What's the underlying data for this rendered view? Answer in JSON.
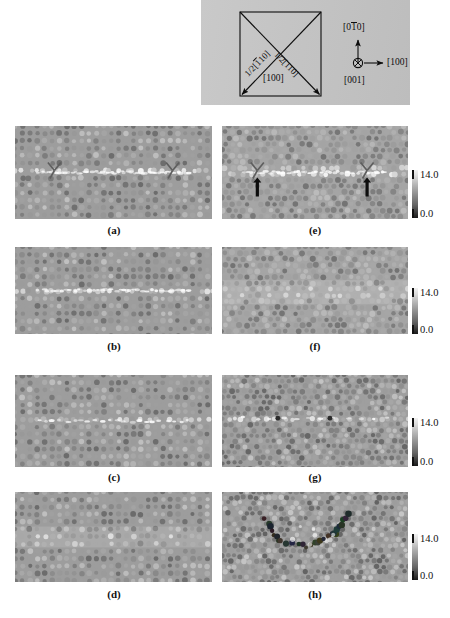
{
  "figure": {
    "type": "multi-panel-micrograph-figure",
    "panel_count": 8
  },
  "schematic": {
    "name": "crystal-orientation-schematic",
    "square_edge_label": "[100]",
    "diagonal_left_label": "1/2[110]",
    "diagonal_left_overbar_index": 1,
    "diagonal_right_label": "1/2[110]",
    "axes": {
      "up_label": "[010]",
      "up_overbar_index": 1,
      "right_label": "[100]",
      "into_page_label": "[001]",
      "into_page_symbol": "⊗"
    }
  },
  "panels": [
    {
      "id": "a",
      "caption": "(a)",
      "column": "left",
      "row": 1,
      "defect": "horizontal-dislocation-line",
      "markers": [
        "y-marker-left",
        "y-marker-right"
      ],
      "lattice": "square-atomic-lattice",
      "noise": "low",
      "has_colorbar": false
    },
    {
      "id": "b",
      "caption": "(b)",
      "column": "left",
      "row": 2,
      "defect": "horizontal-dislocation-line",
      "markers": [],
      "lattice": "square-atomic-lattice",
      "noise": "low",
      "has_colorbar": false
    },
    {
      "id": "c",
      "caption": "(c)",
      "column": "left",
      "row": 3,
      "defect": "short-dislocation-segment",
      "markers": [],
      "lattice": "square-atomic-lattice",
      "noise": "low",
      "has_colorbar": false
    },
    {
      "id": "d",
      "caption": "(d)",
      "column": "left",
      "row": 4,
      "defect": "diffuse-core",
      "markers": [],
      "lattice": "square-atomic-lattice",
      "noise": "low",
      "has_colorbar": false
    },
    {
      "id": "e",
      "caption": "(e)",
      "column": "right",
      "row": 1,
      "defect": "horizontal-dislocation-line",
      "markers": [
        "y-marker-left",
        "y-marker-right",
        "arrow-left",
        "arrow-right"
      ],
      "lattice": "hexagonal-atomic-lattice",
      "noise": "medium",
      "has_colorbar": true
    },
    {
      "id": "f",
      "caption": "(f)",
      "column": "right",
      "row": 2,
      "defect": "diffuse-horizontal-band",
      "markers": [],
      "lattice": "hexagonal-atomic-lattice",
      "noise": "medium",
      "has_colorbar": true
    },
    {
      "id": "g",
      "caption": "(g)",
      "column": "right",
      "row": 3,
      "defect": "point-defect-pair",
      "markers": [
        "dark-spot-left",
        "dark-spot-right"
      ],
      "lattice": "hexagonal-atomic-lattice",
      "noise": "high",
      "has_colorbar": true
    },
    {
      "id": "h",
      "caption": "(h)",
      "column": "right",
      "row": 4,
      "defect": "v-shaped-dark-atom-cluster",
      "markers": [],
      "lattice": "hexagonal-atomic-lattice",
      "noise": "high",
      "has_colorbar": true
    }
  ],
  "colorbar": {
    "name": "grayscale-intensity-colorbar",
    "max_label": "14.0",
    "min_label": "0.0",
    "max_value": 14.0,
    "min_value": 0.0,
    "orientation": "vertical",
    "colormap": "grayscale-inverted"
  },
  "colors": {
    "panel_background": "#9a9a9a",
    "schematic_background": "#c6c6c6",
    "ink": "#0d0d0d",
    "page_background": "#ffffff"
  }
}
